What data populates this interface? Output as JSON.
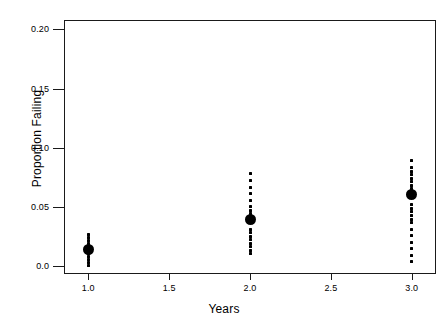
{
  "chart_data": {
    "type": "scatter",
    "title": "",
    "xlabel": "Years",
    "ylabel": "Proportion Failing",
    "xlim": [
      0.85,
      3.15
    ],
    "ylim": [
      -0.007,
      0.208
    ],
    "grid": false,
    "legend": null,
    "x_ticks": [
      1.0,
      1.5,
      2.0,
      2.5,
      3.0
    ],
    "x_tick_labels": [
      "1.0",
      "1.5",
      "2.0",
      "2.5",
      "3.0"
    ],
    "y_ticks": [
      0.0,
      0.05,
      0.1,
      0.15,
      0.2
    ],
    "y_tick_labels": [
      "0.0",
      "0.05",
      "0.10",
      "0.15",
      "0.20"
    ],
    "marker_color": "#000000",
    "frame_color": "#1a1a1a",
    "series": [
      {
        "name": "individual observations",
        "marker": "small-dot",
        "points": [
          {
            "x": 1.0,
            "y": 0.0265
          },
          {
            "x": 1.0,
            "y": 0.024
          },
          {
            "x": 1.0,
            "y": 0.0215
          },
          {
            "x": 1.0,
            "y": 0.019
          },
          {
            "x": 1.0,
            "y": 0.0165
          },
          {
            "x": 1.0,
            "y": 0.0107
          },
          {
            "x": 1.0,
            "y": 0.0081
          },
          {
            "x": 1.0,
            "y": 0.0055
          },
          {
            "x": 1.0,
            "y": 0.003
          },
          {
            "x": 1.0,
            "y": 0.0004
          },
          {
            "x": 2.0,
            "y": 0.078
          },
          {
            "x": 2.0,
            "y": 0.072
          },
          {
            "x": 2.0,
            "y": 0.0665
          },
          {
            "x": 2.0,
            "y": 0.061
          },
          {
            "x": 2.0,
            "y": 0.0555
          },
          {
            "x": 2.0,
            "y": 0.05
          },
          {
            "x": 2.0,
            "y": 0.047
          },
          {
            "x": 2.0,
            "y": 0.044
          },
          {
            "x": 2.0,
            "y": 0.031
          },
          {
            "x": 2.0,
            "y": 0.028
          },
          {
            "x": 2.0,
            "y": 0.025
          },
          {
            "x": 2.0,
            "y": 0.022
          },
          {
            "x": 2.0,
            "y": 0.019
          },
          {
            "x": 2.0,
            "y": 0.016
          },
          {
            "x": 2.0,
            "y": 0.013
          },
          {
            "x": 2.0,
            "y": 0.01
          },
          {
            "x": 3.0,
            "y": 0.089
          },
          {
            "x": 3.0,
            "y": 0.083
          },
          {
            "x": 3.0,
            "y": 0.08
          },
          {
            "x": 3.0,
            "y": 0.077
          },
          {
            "x": 3.0,
            "y": 0.074
          },
          {
            "x": 3.0,
            "y": 0.071
          },
          {
            "x": 3.0,
            "y": 0.068
          },
          {
            "x": 3.0,
            "y": 0.065
          },
          {
            "x": 3.0,
            "y": 0.0515
          },
          {
            "x": 3.0,
            "y": 0.0485
          },
          {
            "x": 3.0,
            "y": 0.0455
          },
          {
            "x": 3.0,
            "y": 0.0425
          },
          {
            "x": 3.0,
            "y": 0.0395
          },
          {
            "x": 3.0,
            "y": 0.0365
          },
          {
            "x": 3.0,
            "y": 0.031
          },
          {
            "x": 3.0,
            "y": 0.0255
          },
          {
            "x": 3.0,
            "y": 0.02
          },
          {
            "x": 3.0,
            "y": 0.0145
          },
          {
            "x": 3.0,
            "y": 0.009
          },
          {
            "x": 3.0,
            "y": 0.0035
          }
        ]
      },
      {
        "name": "mean proportion failing",
        "marker": "large-dot",
        "points": [
          {
            "x": 1.0,
            "y": 0.0136
          },
          {
            "x": 2.0,
            "y": 0.039
          },
          {
            "x": 3.0,
            "y": 0.06
          }
        ]
      }
    ]
  }
}
